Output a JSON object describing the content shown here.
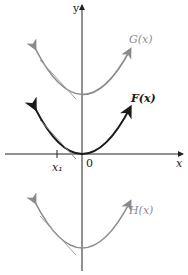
{
  "figure": {
    "axes": {
      "x_label": "x",
      "y_label": "y",
      "origin_label": "0",
      "tick_label": "x₁"
    },
    "curves": [
      {
        "name": "G",
        "label": "G(x)",
        "color": "#8a8a8a",
        "vertex": [
          0,
          "above"
        ]
      },
      {
        "name": "F",
        "label": "F(x)",
        "color": "#1a1a1a",
        "vertex": [
          0,
          0
        ]
      },
      {
        "name": "H",
        "label": "H(x)",
        "color": "#8a8a8a",
        "vertex": [
          0,
          "below"
        ]
      }
    ],
    "tangent_color": "#9a9a9a",
    "axis_color": "#222222"
  }
}
